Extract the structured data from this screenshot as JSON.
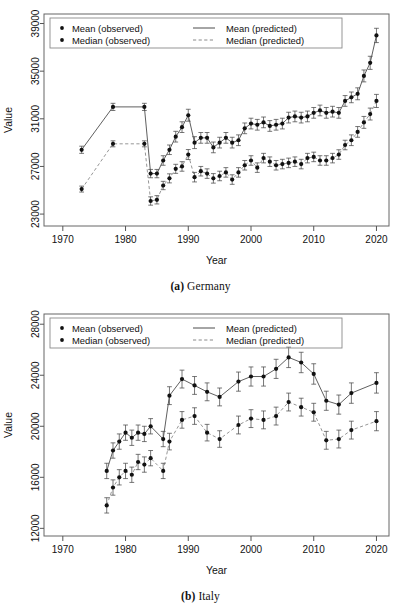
{
  "figures": [
    {
      "id": "germany",
      "caption_label": "(a)",
      "caption_name": "Germany",
      "chart_data": {
        "type": "line",
        "title": "",
        "xlabel": "Year",
        "ylabel": "Value",
        "xlim": [
          1967,
          2022
        ],
        "ylim": [
          22000,
          39800
        ],
        "xticks": [
          1970,
          1980,
          1990,
          2000,
          2010,
          2020
        ],
        "yticks": [
          23000,
          27000,
          31000,
          35000,
          39000
        ],
        "grid": false,
        "legend_position": "top-left",
        "legend": [
          "Mean (observed)",
          "Median (observed)",
          "Mean (predicted)",
          "Median (predicted)"
        ],
        "series": [
          {
            "name": "Mean",
            "style": "solid",
            "x": [
              1973,
              1978,
              1983,
              1984,
              1985,
              1986,
              1987,
              1988,
              1989,
              1990,
              1991,
              1992,
              1993,
              1994,
              1995,
              1996,
              1997,
              1998,
              1999,
              2000,
              2001,
              2002,
              2003,
              2004,
              2005,
              2006,
              2007,
              2008,
              2009,
              2010,
              2011,
              2012,
              2013,
              2014,
              2015,
              2016,
              2017,
              2018,
              2019,
              2020
            ],
            "values": [
              28400,
              32000,
              32000,
              26400,
              26400,
              27500,
              28400,
              29500,
              30300,
              31300,
              29000,
              29400,
              29400,
              28600,
              29000,
              29400,
              29000,
              29200,
              30200,
              30600,
              30500,
              30700,
              30400,
              30500,
              30600,
              31100,
              31200,
              31100,
              31200,
              31500,
              31700,
              31500,
              31600,
              31500,
              32500,
              32800,
              33100,
              34600,
              35700,
              38000
            ],
            "err": [
              300,
              300,
              300,
              350,
              350,
              400,
              400,
              450,
              450,
              500,
              500,
              450,
              450,
              450,
              450,
              450,
              450,
              450,
              450,
              450,
              450,
              450,
              450,
              450,
              450,
              450,
              450,
              450,
              450,
              450,
              450,
              450,
              450,
              450,
              450,
              450,
              500,
              500,
              550,
              600
            ]
          },
          {
            "name": "Median",
            "style": "dashed",
            "x": [
              1973,
              1978,
              1983,
              1984,
              1985,
              1986,
              1987,
              1988,
              1989,
              1990,
              1991,
              1992,
              1993,
              1994,
              1995,
              1996,
              1997,
              1998,
              1999,
              2000,
              2001,
              2002,
              2003,
              2004,
              2005,
              2006,
              2007,
              2008,
              2009,
              2010,
              2011,
              2012,
              2013,
              2014,
              2015,
              2016,
              2017,
              2018,
              2019,
              2020
            ],
            "values": [
              25100,
              28900,
              28900,
              24100,
              24200,
              25400,
              26000,
              26800,
              27000,
              28000,
              26100,
              26600,
              26400,
              26000,
              26200,
              26500,
              25900,
              26500,
              27100,
              27500,
              26900,
              27700,
              27400,
              27100,
              27200,
              27300,
              27400,
              27200,
              27700,
              27800,
              27500,
              27500,
              27700,
              28000,
              28800,
              29200,
              29900,
              30700,
              31400,
              32500
            ],
            "err": [
              250,
              250,
              250,
              350,
              350,
              350,
              380,
              380,
              400,
              420,
              400,
              400,
              400,
              400,
              400,
              400,
              400,
              400,
              400,
              400,
              400,
              400,
              400,
              400,
              400,
              400,
              400,
              400,
              400,
              400,
              400,
              400,
              400,
              400,
              400,
              450,
              450,
              500,
              500,
              550
            ]
          }
        ]
      }
    },
    {
      "id": "italy",
      "caption_label": "(b)",
      "caption_name": "Italy",
      "chart_data": {
        "type": "line",
        "title": "",
        "xlabel": "Year",
        "ylabel": "Value",
        "xlim": [
          1967,
          2022
        ],
        "ylim": [
          11400,
          28800
        ],
        "xticks": [
          1970,
          1980,
          1990,
          2000,
          2010,
          2020
        ],
        "yticks": [
          12000,
          16000,
          20000,
          24000,
          28000
        ],
        "grid": false,
        "legend_position": "top-left",
        "legend": [
          "Mean (observed)",
          "Median (observed)",
          "Mean (predicted)",
          "Median (predicted)"
        ],
        "series": [
          {
            "name": "Mean",
            "style": "solid",
            "x": [
              1977,
              1978,
              1979,
              1980,
              1981,
              1982,
              1983,
              1984,
              1986,
              1987,
              1989,
              1991,
              1993,
              1995,
              1998,
              2000,
              2002,
              2004,
              2006,
              2008,
              2010,
              2012,
              2014,
              2016,
              2020
            ],
            "values": [
              16500,
              18100,
              18800,
              19500,
              19100,
              19500,
              19400,
              20000,
              19000,
              22400,
              23700,
              23200,
              22700,
              22300,
              23500,
              23900,
              23900,
              24500,
              25400,
              25000,
              24100,
              22000,
              21700,
              22600,
              23400
            ],
            "err": [
              600,
              600,
              600,
              600,
              600,
              600,
              600,
              600,
              600,
              700,
              700,
              700,
              700,
              700,
              750,
              750,
              750,
              750,
              800,
              800,
              800,
              750,
              750,
              800,
              800
            ]
          },
          {
            "name": "Median",
            "style": "dashed",
            "x": [
              1977,
              1978,
              1979,
              1980,
              1981,
              1982,
              1983,
              1984,
              1986,
              1987,
              1989,
              1991,
              1993,
              1995,
              1998,
              2000,
              2002,
              2004,
              2006,
              2008,
              2010,
              2012,
              2014,
              2016,
              2020
            ],
            "values": [
              13800,
              15200,
              16000,
              16500,
              16200,
              17200,
              17000,
              17500,
              16500,
              18800,
              20500,
              20800,
              19500,
              19000,
              20100,
              20600,
              20500,
              20800,
              21900,
              21500,
              21100,
              18900,
              19000,
              19700,
              20400
            ],
            "err": [
              600,
              600,
              600,
              600,
              600,
              600,
              600,
              600,
              600,
              650,
              650,
              650,
              650,
              650,
              700,
              700,
              700,
              700,
              700,
              700,
              700,
              700,
              700,
              700,
              750
            ]
          }
        ]
      }
    }
  ],
  "icons": {
    "point_marker": "filled-diamond-marker",
    "solid_line": "solid-line-swatch",
    "dashed_line": "dashed-line-swatch"
  }
}
